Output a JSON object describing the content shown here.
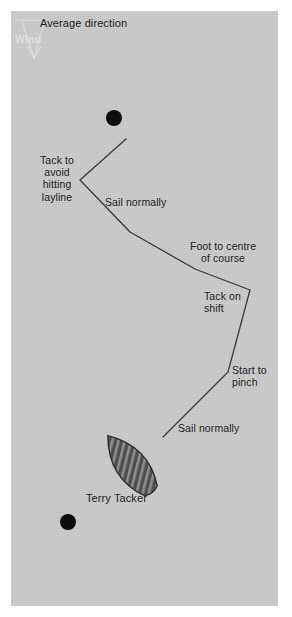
{
  "diagram": {
    "background_color": "#c9c9c9",
    "page_color": "#ffffff",
    "line_color": "#3a3a3a",
    "text_color": "#1c1c1c",
    "mark_color": "#0d0d0d",
    "hull_color": "#4a4a4a",
    "hull_stripe_color": "#8c8c8c",
    "wind_label_color": "#e4e4e4"
  },
  "labels": {
    "average_direction": "Average direction",
    "wind": "Wind",
    "tack_to_avoid_hitting_layline": "Tack to\navoid\nhitting\nlayline",
    "sail_normally_upper": "Sail normally",
    "foot_to_centre_of_course": "Foot to centre\nof course",
    "tack_on_shift": "Tack on\nshift",
    "start_to_pinch": "Start to\npinch",
    "sail_normally_lower": "Sail normally",
    "boat_name": "Terry Tacker"
  },
  "marks": [
    {
      "name": "windward-mark",
      "cx": 114,
      "cy": 118,
      "r": 8
    },
    {
      "name": "leeward-mark",
      "cx": 68,
      "cy": 522,
      "r": 8
    }
  ],
  "course_path": {
    "name": "boat-track",
    "points": [
      {
        "x": 163,
        "y": 437
      },
      {
        "x": 228,
        "y": 372
      },
      {
        "x": 250,
        "y": 290
      },
      {
        "x": 195,
        "y": 269
      },
      {
        "x": 130,
        "y": 232
      },
      {
        "x": 80,
        "y": 180
      },
      {
        "x": 126,
        "y": 139
      }
    ]
  },
  "wind_arrow": {
    "name": "wind-direction-arrow",
    "tip_x": 33,
    "tip_y": 57,
    "tail_x": 24,
    "tail_y": 20,
    "bar_x1": 15,
    "bar_x2": 42,
    "bar_y": 20
  },
  "boat": {
    "name": "terry-tacker-hull",
    "cx": 130,
    "cy": 464,
    "length": 72,
    "beam": 40,
    "rotation_deg": -38,
    "stripe_count": 14
  }
}
